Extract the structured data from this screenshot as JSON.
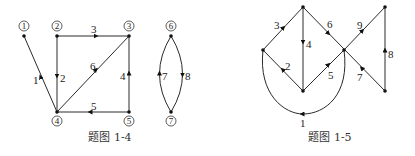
{
  "figures": [
    {
      "caption": "题图 1-4",
      "nodes": [
        {
          "id": "1",
          "label": "1"
        },
        {
          "id": "2",
          "label": "2"
        },
        {
          "id": "3",
          "label": "3"
        },
        {
          "id": "4",
          "label": "4"
        },
        {
          "id": "5",
          "label": "5"
        },
        {
          "id": "6",
          "label": "6"
        },
        {
          "id": "7",
          "label": "7"
        }
      ],
      "edges": [
        {
          "label": "1",
          "from": "4",
          "to": "1"
        },
        {
          "label": "2",
          "from": "2",
          "to": "4"
        },
        {
          "label": "3",
          "from": "2",
          "to": "3"
        },
        {
          "label": "4",
          "from": "5",
          "to": "3"
        },
        {
          "label": "5",
          "from": "5",
          "to": "4"
        },
        {
          "label": "6",
          "from": "4",
          "to": "3"
        },
        {
          "label": "7",
          "from": "7",
          "to": "6"
        },
        {
          "label": "8",
          "from": "6",
          "to": "7"
        }
      ]
    },
    {
      "caption": "题图 1-5",
      "edges": [
        {
          "label": "1"
        },
        {
          "label": "2"
        },
        {
          "label": "3"
        },
        {
          "label": "4"
        },
        {
          "label": "5"
        },
        {
          "label": "6"
        },
        {
          "label": "7"
        },
        {
          "label": "8"
        },
        {
          "label": "9"
        }
      ]
    }
  ]
}
